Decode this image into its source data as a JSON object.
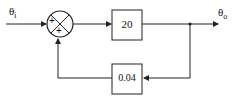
{
  "diagram": {
    "input_label": "θ",
    "input_sub": "i",
    "output_label": "θ",
    "output_sub": "o",
    "sum_signs": [
      "+",
      "+"
    ],
    "forward_gain": "20",
    "feedback_gain": "0.04",
    "colors": {
      "line": "#222222",
      "background": "#ffffff"
    }
  }
}
